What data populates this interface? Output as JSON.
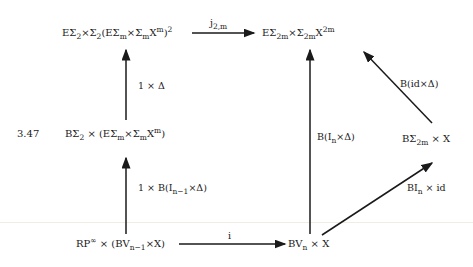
{
  "equation_number": "3.47",
  "nodes": {
    "top_left": {
      "pre": "EΣ",
      "s1": "2",
      "mid": "×Σ",
      "s2": "2",
      "mid2": "(EΣ",
      "s3": "m",
      "mid3": "×Σ",
      "s4": "m",
      "mid4": "X",
      "sup1": "m",
      "post": ")",
      "sup2": "2"
    },
    "top_right": {
      "pre": "EΣ",
      "s1": "2m",
      "mid": "×Σ",
      "s2": "2m",
      "mid2": "X",
      "sup1": "2m"
    },
    "mid_left": {
      "pre": "BΣ",
      "s1": "2",
      "mid": " × (EΣ",
      "s2": "m",
      "mid2": "×Σ",
      "s3": "m",
      "mid3": "X",
      "sup1": "m",
      "post": ")"
    },
    "mid_right": {
      "pre": "BΣ",
      "s1": "2m",
      "post": " × X"
    },
    "bottom_left": {
      "pre": "RP",
      "sup1": "∞",
      "mid": " × (BV",
      "s1": "n−1",
      "post": "×X)"
    },
    "bottom_right": {
      "pre": "BV",
      "s1": "n",
      "post": " × X"
    }
  },
  "arrows": {
    "top_horizontal": {
      "pre": "j",
      "s1": "2,m"
    },
    "left_upper": {
      "text": "1 × Δ"
    },
    "left_lower": {
      "pre": "1 × B(I",
      "s1": "n−1",
      "post": "×Δ)"
    },
    "right_vertical": {
      "pre": "B(I",
      "s1": "n",
      "post": "×Δ)"
    },
    "diag_upper": {
      "text": "B(id×Δ)"
    },
    "diag_lower": {
      "pre": "BI",
      "s1": "n",
      "post": " × id"
    },
    "bottom_horizontal": {
      "text": "i"
    }
  }
}
